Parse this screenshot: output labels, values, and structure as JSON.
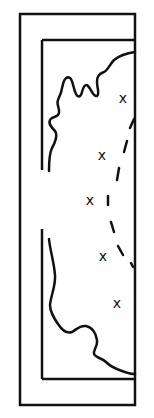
{
  "diagram": {
    "type": "map-sketch",
    "colors": {
      "stroke": "#111111",
      "background": "#ffffff"
    },
    "outer_frame": {
      "x": 20,
      "y": 14,
      "width": 115,
      "height": 391
    },
    "inner_frame": {
      "x": 42,
      "y": 40,
      "right": 135,
      "bottom": 379,
      "left_gap": [
        170,
        229
      ]
    },
    "marks": [
      {
        "label": "x",
        "x": 123,
        "y": 98
      },
      {
        "label": "x",
        "x": 102,
        "y": 155
      },
      {
        "label": "x",
        "x": 90,
        "y": 200
      },
      {
        "label": "x",
        "x": 103,
        "y": 256
      },
      {
        "label": "x",
        "x": 117,
        "y": 303
      }
    ],
    "dashed_boundary": "arc of dashes from right edge near top curving left then back to right edge"
  }
}
